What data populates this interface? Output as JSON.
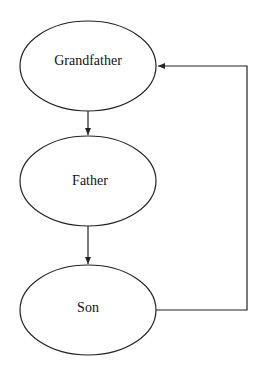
{
  "diagram": {
    "nodes": [
      {
        "id": "grandfather",
        "label": "Grandfather"
      },
      {
        "id": "father",
        "label": "Father"
      },
      {
        "id": "son",
        "label": "Son"
      }
    ],
    "edges": [
      {
        "from": "grandfather",
        "to": "father"
      },
      {
        "from": "father",
        "to": "son"
      },
      {
        "from": "son",
        "to": "grandfather"
      }
    ],
    "colors": {
      "stroke": "#222222",
      "background": "#ffffff"
    }
  }
}
